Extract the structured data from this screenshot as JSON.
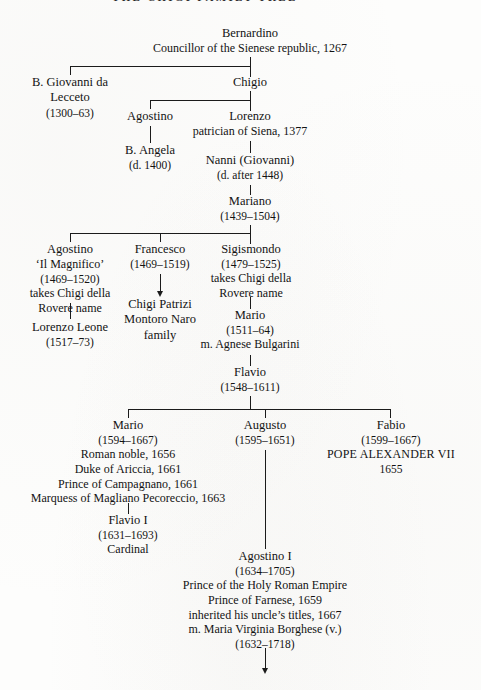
{
  "document": {
    "type": "genealogical-family-tree",
    "title_clipped": "THE CHIGI FAMILY TREE",
    "continuation_marker": "arrow-down"
  },
  "nodes": {
    "bernardino": {
      "name": "Bernardino",
      "detail": "Councillor of the Sienese republic, 1267"
    },
    "giovanni_lecceto": {
      "name": "B. Giovanni da",
      "name2": "Lecceto",
      "dates": "(1300–63)"
    },
    "chigio": {
      "name": "Chigio"
    },
    "agostino_1": {
      "name": "Agostino"
    },
    "lorenzo": {
      "name": "Lorenzo",
      "detail": "patrician of Siena, 1377"
    },
    "angela": {
      "name": "B. Angela",
      "dates": "(d. 1400)"
    },
    "nanni": {
      "name": "Nanni (Giovanni)",
      "dates": "(d. after 1448)"
    },
    "mariano": {
      "name": "Mariano",
      "dates": "(1439–1504)"
    },
    "agostino_magnifico": {
      "name": "Agostino",
      "epithet": "‘Il Magnifico’",
      "dates": "(1469–1520)",
      "note1": "takes Chigi della",
      "note2": "Rovere name"
    },
    "francesco": {
      "name": "Francesco",
      "dates": "(1469–1519)"
    },
    "sigismondo": {
      "name": "Sigismondo",
      "dates": "(1479–1525)",
      "note1": "takes Chigi della",
      "note2": "Rovere name"
    },
    "chigi_patrizi": {
      "line1": "Chigi Patrizi",
      "line2": "Montoro Naro",
      "line3": "family"
    },
    "lorenzo_leone": {
      "name": "Lorenzo Leone",
      "dates": "(1517–73)"
    },
    "mario_1511": {
      "name": "Mario",
      "dates": "(1511–64)",
      "marriage": "m. Agnese Bulgarini"
    },
    "flavio": {
      "name": "Flavio",
      "dates": "(1548–1611)"
    },
    "mario_1594": {
      "name": "Mario",
      "dates": "(1594–1667)",
      "title1": "Roman noble, 1656",
      "title2": "Duke of Ariccia, 1661",
      "title3": "Prince of Campagnano, 1661",
      "title4": "Marquess of Magliano Pecoreccio, 1663"
    },
    "augusto": {
      "name": "Augusto",
      "dates": "(1595–1651)"
    },
    "fabio": {
      "name": "Fabio",
      "dates": "(1599–1667)",
      "papal_title": "POPE ALEXANDER VII",
      "papal_year": "1655"
    },
    "flavio_i": {
      "name": "Flavio I",
      "dates": "(1631–1693)",
      "rank": "Cardinal"
    },
    "agostino_i": {
      "name": "Agostino I",
      "dates": "(1634–1705)",
      "title1": "Prince of the Holy Roman Empire",
      "title2": "Prince of Farnese, 1659",
      "title3": "inherited his uncle’s titles, 1667",
      "marriage": "m. Maria Virginia Borghese (v.)",
      "wife_dates": "(1632–1718)"
    }
  },
  "colors": {
    "ink": "#131313",
    "rule": "#1b1b1b",
    "page": "#fdfdfc"
  }
}
